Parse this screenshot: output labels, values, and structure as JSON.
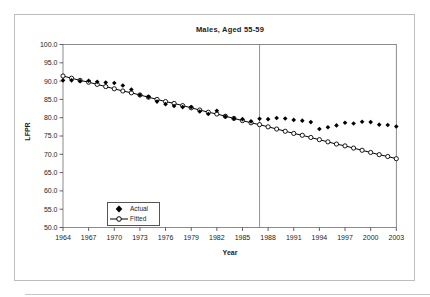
{
  "chart_data": {
    "type": "line",
    "title": "Males, Aged 55-59",
    "xlabel": "Year",
    "ylabel": "LFPR",
    "xlim": [
      1964,
      2003
    ],
    "ylim": [
      50.0,
      100.0
    ],
    "grid": false,
    "legend_position": "lower-left-inside",
    "vertical_marker_year": 1987,
    "x_ticks": [
      1964,
      1967,
      1970,
      1973,
      1976,
      1979,
      1982,
      1985,
      1988,
      1991,
      1994,
      1997,
      2000,
      2003
    ],
    "x_tick_labels": [
      "1964",
      "1967",
      "1970",
      "1973",
      "1976",
      "1979",
      "1982",
      "1985",
      "1988",
      "1991",
      "1994",
      "1997",
      "2000",
      "2003"
    ],
    "y_ticks": [
      100.0,
      95.0,
      90.0,
      85.0,
      80.0,
      75.0,
      70.0,
      65.0,
      60.0,
      55.0,
      50.0
    ],
    "y_tick_labels": [
      "100.0",
      "95.0",
      "90.0",
      "85.0",
      "80.0",
      "75.0",
      "70.0",
      "65.0",
      "60.0",
      "55.0",
      "50.0"
    ],
    "x": [
      1964,
      1965,
      1966,
      1967,
      1968,
      1969,
      1970,
      1971,
      1972,
      1973,
      1974,
      1975,
      1976,
      1977,
      1978,
      1979,
      1980,
      1981,
      1982,
      1983,
      1984,
      1985,
      1986,
      1987,
      1988,
      1989,
      1990,
      1991,
      1992,
      1993,
      1994,
      1995,
      1996,
      1997,
      1998,
      1999,
      2000,
      2001,
      2002,
      2003
    ],
    "series": [
      {
        "name": "Actual",
        "marker": "filled-diamond",
        "line": false,
        "color": "#000000",
        "values": [
          90.2,
          90.2,
          90.0,
          90.1,
          89.8,
          89.6,
          89.5,
          88.8,
          87.7,
          86.2,
          85.7,
          84.4,
          83.7,
          83.2,
          82.9,
          82.9,
          81.7,
          81.0,
          81.9,
          80.3,
          79.8,
          79.6,
          79.0,
          79.7,
          79.6,
          79.9,
          79.8,
          79.4,
          79.2,
          78.8,
          76.9,
          77.4,
          77.9,
          78.6,
          78.4,
          78.9,
          78.8,
          78.1,
          78.0,
          77.6
        ]
      },
      {
        "name": "Fitted",
        "marker": "open-circle",
        "line": true,
        "color": "#000000",
        "values": [
          91.4,
          90.8,
          90.2,
          89.7,
          89.1,
          88.5,
          87.9,
          87.3,
          86.8,
          86.2,
          85.6,
          85.0,
          84.4,
          83.9,
          83.3,
          82.7,
          82.1,
          81.5,
          81.0,
          80.4,
          79.8,
          79.2,
          78.6,
          78.1,
          77.5,
          76.9,
          76.3,
          75.7,
          75.2,
          74.6,
          74.0,
          73.4,
          72.8,
          72.3,
          71.7,
          71.1,
          70.5,
          69.9,
          69.4,
          68.8
        ]
      }
    ]
  },
  "colors": {
    "series": "#000000",
    "plot_border": "#6e6e6e",
    "axis_tick": "#3a3a3a",
    "vertical_marker_line": "#7a7a7a",
    "frame_border": "#bdbdbd"
  }
}
